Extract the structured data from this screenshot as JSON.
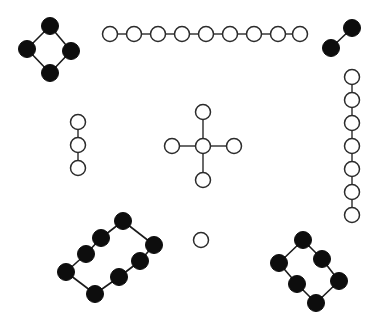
{
  "figure": {
    "width": 382,
    "height": 322,
    "background_color": "#ffffff",
    "node_styles": {
      "open": {
        "fill": "#ffffff",
        "stroke": "#2b2b2b",
        "radius": 7.5
      },
      "filled": {
        "fill": "#0d0d0d",
        "stroke": "#0d0d0d",
        "radius": 8.5
      }
    },
    "edge_style": {
      "stroke": "#1a1a1a",
      "width": 1.3
    }
  },
  "components": [
    {
      "id": "cycle-4-filled-topleft",
      "name": "four-node-cycle-filled",
      "style": "filled",
      "node_count": 4,
      "edge_count": 4,
      "nodes": [
        {
          "id": "a0",
          "x": 50,
          "y": 26
        },
        {
          "id": "a1",
          "x": 27,
          "y": 49
        },
        {
          "id": "a2",
          "x": 71,
          "y": 51
        },
        {
          "id": "a3",
          "x": 50,
          "y": 73
        }
      ],
      "edges": [
        {
          "from": "a0",
          "to": "a1"
        },
        {
          "from": "a0",
          "to": "a2"
        },
        {
          "from": "a1",
          "to": "a3"
        },
        {
          "from": "a2",
          "to": "a3"
        }
      ]
    },
    {
      "id": "path-9-open-top",
      "name": "nine-node-horizontal-path",
      "style": "open",
      "node_count": 9,
      "edge_count": 8,
      "nodes": [
        {
          "id": "b0",
          "x": 110,
          "y": 34
        },
        {
          "id": "b1",
          "x": 134,
          "y": 34
        },
        {
          "id": "b2",
          "x": 158,
          "y": 34
        },
        {
          "id": "b3",
          "x": 182,
          "y": 34
        },
        {
          "id": "b4",
          "x": 206,
          "y": 34
        },
        {
          "id": "b5",
          "x": 230,
          "y": 34
        },
        {
          "id": "b6",
          "x": 254,
          "y": 34
        },
        {
          "id": "b7",
          "x": 278,
          "y": 34
        },
        {
          "id": "b8",
          "x": 300,
          "y": 34
        }
      ],
      "edges": [
        {
          "from": "b0",
          "to": "b1"
        },
        {
          "from": "b1",
          "to": "b2"
        },
        {
          "from": "b2",
          "to": "b3"
        },
        {
          "from": "b3",
          "to": "b4"
        },
        {
          "from": "b4",
          "to": "b5"
        },
        {
          "from": "b5",
          "to": "b6"
        },
        {
          "from": "b6",
          "to": "b7"
        },
        {
          "from": "b7",
          "to": "b8"
        }
      ]
    },
    {
      "id": "edge-2-filled-topright",
      "name": "two-node-edge-filled",
      "style": "filled",
      "node_count": 2,
      "edge_count": 1,
      "nodes": [
        {
          "id": "c0",
          "x": 352,
          "y": 28
        },
        {
          "id": "c1",
          "x": 331,
          "y": 48
        }
      ],
      "edges": [
        {
          "from": "c0",
          "to": "c1"
        }
      ]
    },
    {
      "id": "path-7-open-right",
      "name": "seven-node-vertical-path",
      "style": "open",
      "node_count": 7,
      "edge_count": 6,
      "nodes": [
        {
          "id": "d0",
          "x": 352,
          "y": 77
        },
        {
          "id": "d1",
          "x": 352,
          "y": 100
        },
        {
          "id": "d2",
          "x": 352,
          "y": 123
        },
        {
          "id": "d3",
          "x": 352,
          "y": 146
        },
        {
          "id": "d4",
          "x": 352,
          "y": 169
        },
        {
          "id": "d5",
          "x": 352,
          "y": 192
        },
        {
          "id": "d6",
          "x": 352,
          "y": 215
        }
      ],
      "edges": [
        {
          "from": "d0",
          "to": "d1"
        },
        {
          "from": "d1",
          "to": "d2"
        },
        {
          "from": "d2",
          "to": "d3"
        },
        {
          "from": "d3",
          "to": "d4"
        },
        {
          "from": "d4",
          "to": "d5"
        },
        {
          "from": "d5",
          "to": "d6"
        }
      ]
    },
    {
      "id": "path-3-open-left",
      "name": "three-node-vertical-path",
      "style": "open",
      "node_count": 3,
      "edge_count": 2,
      "nodes": [
        {
          "id": "e0",
          "x": 78,
          "y": 122
        },
        {
          "id": "e1",
          "x": 78,
          "y": 145
        },
        {
          "id": "e2",
          "x": 78,
          "y": 168
        }
      ],
      "edges": [
        {
          "from": "e0",
          "to": "e1"
        },
        {
          "from": "e1",
          "to": "e2"
        }
      ]
    },
    {
      "id": "star-5-open-center",
      "name": "five-node-star-graph",
      "style": "open",
      "node_count": 5,
      "edge_count": 4,
      "nodes": [
        {
          "id": "f_center",
          "x": 203,
          "y": 146
        },
        {
          "id": "f_up",
          "x": 203,
          "y": 112
        },
        {
          "id": "f_down",
          "x": 203,
          "y": 180
        },
        {
          "id": "f_left",
          "x": 172,
          "y": 146
        },
        {
          "id": "f_right",
          "x": 234,
          "y": 146
        }
      ],
      "edges": [
        {
          "from": "f_center",
          "to": "f_up"
        },
        {
          "from": "f_center",
          "to": "f_down"
        },
        {
          "from": "f_center",
          "to": "f_left"
        },
        {
          "from": "f_center",
          "to": "f_right"
        }
      ]
    },
    {
      "id": "isolated-1-open-center",
      "name": "isolated-single-node",
      "style": "open",
      "node_count": 1,
      "edge_count": 0,
      "nodes": [
        {
          "id": "g0",
          "x": 201,
          "y": 240
        }
      ],
      "edges": []
    },
    {
      "id": "cycle-8-filled-bottomleft",
      "name": "eight-node-cycle-filled",
      "style": "filled",
      "node_count": 8,
      "edge_count": 8,
      "nodes": [
        {
          "id": "h0",
          "x": 123,
          "y": 221
        },
        {
          "id": "h1",
          "x": 101,
          "y": 238
        },
        {
          "id": "h2",
          "x": 86,
          "y": 254
        },
        {
          "id": "h3",
          "x": 66,
          "y": 272
        },
        {
          "id": "h4",
          "x": 95,
          "y": 294
        },
        {
          "id": "h5",
          "x": 119,
          "y": 277
        },
        {
          "id": "h6",
          "x": 140,
          "y": 261
        },
        {
          "id": "h7",
          "x": 154,
          "y": 245
        }
      ],
      "edges": [
        {
          "from": "h0",
          "to": "h1"
        },
        {
          "from": "h1",
          "to": "h2"
        },
        {
          "from": "h2",
          "to": "h3"
        },
        {
          "from": "h3",
          "to": "h4"
        },
        {
          "from": "h4",
          "to": "h5"
        },
        {
          "from": "h5",
          "to": "h6"
        },
        {
          "from": "h6",
          "to": "h7"
        },
        {
          "from": "h7",
          "to": "h0"
        }
      ]
    },
    {
      "id": "cycle-6-filled-bottomright",
      "name": "six-node-cycle-filled",
      "style": "filled",
      "node_count": 6,
      "edge_count": 6,
      "nodes": [
        {
          "id": "i0",
          "x": 303,
          "y": 240
        },
        {
          "id": "i1",
          "x": 279,
          "y": 263
        },
        {
          "id": "i2",
          "x": 322,
          "y": 259
        },
        {
          "id": "i3",
          "x": 297,
          "y": 284
        },
        {
          "id": "i4",
          "x": 339,
          "y": 281
        },
        {
          "id": "i5",
          "x": 316,
          "y": 303
        }
      ],
      "edges": [
        {
          "from": "i0",
          "to": "i1"
        },
        {
          "from": "i0",
          "to": "i2"
        },
        {
          "from": "i1",
          "to": "i3"
        },
        {
          "from": "i2",
          "to": "i4"
        },
        {
          "from": "i3",
          "to": "i5"
        },
        {
          "from": "i4",
          "to": "i5"
        }
      ]
    }
  ]
}
